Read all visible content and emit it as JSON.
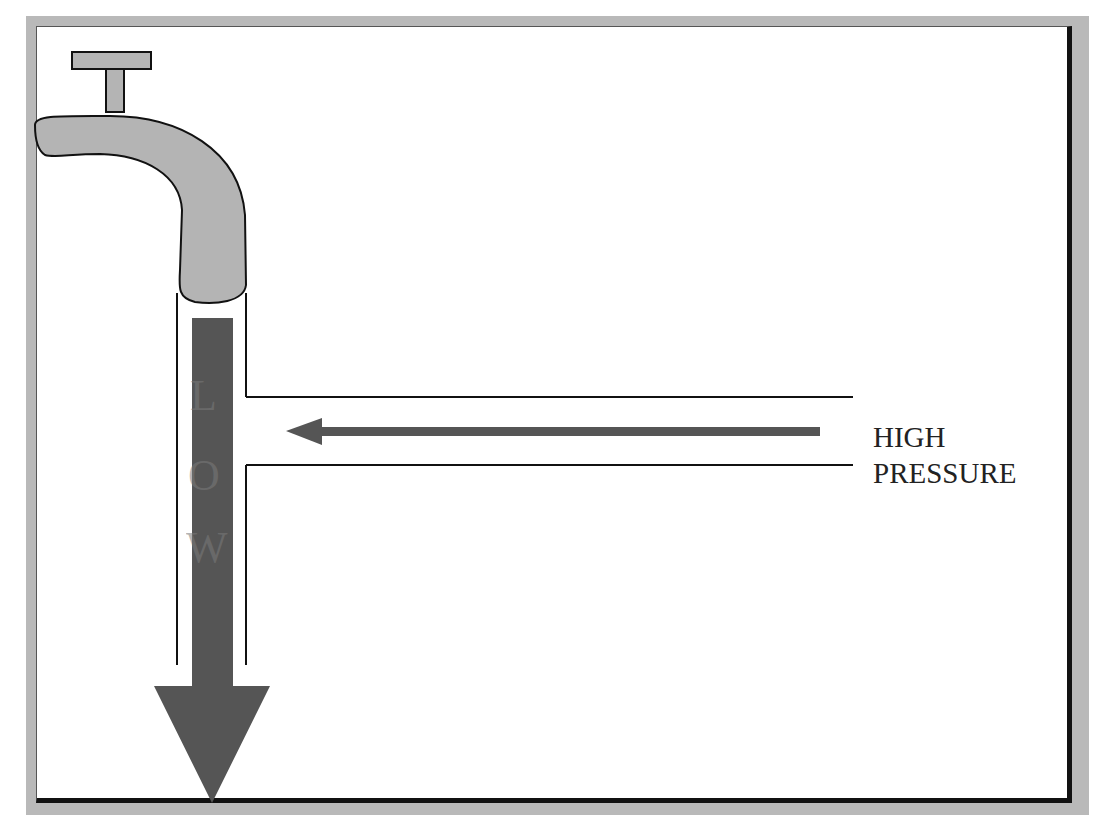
{
  "diagram": {
    "high_pressure_label_line1": "HIGH",
    "high_pressure_label_line2": "PRESSURE",
    "flow_letters": [
      "L",
      "O",
      "W"
    ],
    "colors": {
      "faucet_fill": "#b4b4b4",
      "arrow_fill": "#555555",
      "frame": "#b9b9b9",
      "outline": "#111111"
    }
  }
}
